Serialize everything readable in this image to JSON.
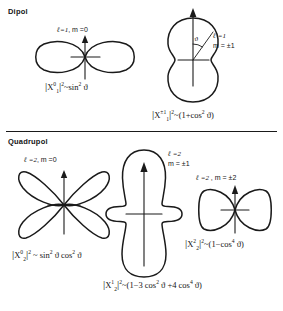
{
  "figure": {
    "sections": [
      {
        "id": "dipole",
        "heading": "Dipol"
      },
      {
        "id": "quadrupole",
        "heading": "Quadrupol"
      }
    ],
    "divider": true
  },
  "dipole": {
    "panels": [
      {
        "id": "dipole-m0",
        "label_ell": "ℓ=1",
        "label_sep": ",",
        "label_m": "m =0",
        "formula": "|X₁⁰|² ~ sin² ϑ",
        "formula_parts": {
          "bar_open": "|",
          "symbol": "X",
          "superscript": "0",
          "subscript": "1",
          "bar_close": "|",
          "power": "2",
          "tilde": "~",
          "expression": "sin",
          "exponent": "2",
          "angle": "ϑ"
        },
        "shape": "two-lobe-horizontal"
      },
      {
        "id": "dipole-m1",
        "label_ell": "ℓ =1",
        "label_m": "m = ±1",
        "formula": "|X₁¹|² ~ (1+cos² ϑ)",
        "formula_parts": {
          "bar_open": "|",
          "symbol": "X",
          "superscript": "±1",
          "subscript": "1",
          "bar_close": "|",
          "power": "2",
          "tilde": "~",
          "expr_open": "(1+cos",
          "exponent": "2",
          "angle": "ϑ",
          "expr_close": ")"
        },
        "shape": "peanut-vertical",
        "angle_marker": "ϑ"
      }
    ]
  },
  "quadrupole": {
    "panels": [
      {
        "id": "quad-m0",
        "label_ell": "ℓ =2",
        "label_sep": ",",
        "label_m": "m =0",
        "formula": "|X₂⁰|² ~ sin² ϑ cos² ϑ",
        "formula_parts": {
          "bar_open": "|",
          "symbol": "X",
          "superscript": "0",
          "subscript": "2",
          "bar_close": "|",
          "power": "2",
          "tilde": "~",
          "expr_a": "sin",
          "exp_a": "2",
          "angle_a": "ϑ",
          "expr_b": "cos",
          "exp_b": "2",
          "angle_b": "ϑ"
        },
        "shape": "four-lobe-clover"
      },
      {
        "id": "quad-m1",
        "label_ell": "ℓ =2",
        "label_m": "m = ±1",
        "formula": "|X₂¹|² ~ (1−3 cos² ϑ +4 cos⁴ ϑ)",
        "formula_parts": {
          "bar_open": "|",
          "symbol": "X",
          "superscript": "1",
          "subscript": "2",
          "bar_close": "|",
          "power": "2",
          "tilde": "~",
          "expr_open": "(1−3 cos",
          "exp_a": "2",
          "angle_a": "ϑ",
          "expr_mid": "+4 cos",
          "exp_b": "4",
          "angle_b": "ϑ",
          "expr_close": ")"
        },
        "shape": "elongated-vertical-with-side-lobes"
      },
      {
        "id": "quad-m2",
        "label_ell": "ℓ =2",
        "label_sep": ",",
        "label_m": "m = ±2",
        "formula": "|X₂²|² ~ (1−cos⁴ ϑ)",
        "formula_parts": {
          "bar_open": "|",
          "symbol": "X",
          "superscript": "2",
          "subscript": "2",
          "bar_close": "|",
          "power": "2",
          "tilde": "~",
          "expr_open": "(1−cos",
          "exponent": "4",
          "angle": "ϑ",
          "expr_close": ")"
        },
        "shape": "two-lobe-horizontal-wide"
      }
    ]
  }
}
